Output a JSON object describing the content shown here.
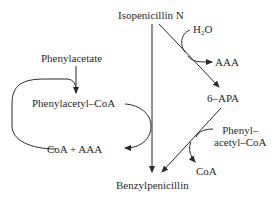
{
  "diagram": {
    "nodes": {
      "isopenicillin_n": "Isopenicillin N",
      "water_prefix": "H",
      "water_sub": "2",
      "water_suffix": "O",
      "aaa_top": "AAA",
      "six_apa": "6–APA",
      "phenylacetate": "Phenylacetate",
      "phenylacetyl_coa": "Phenylacetyl–CoA",
      "coa_plus_aaa": "CoA + AAA",
      "phenylacetyl_coa_right_line1": "Phenyl–",
      "phenylacetyl_coa_right_line2": "acetyl–CoA",
      "coa_right": "CoA",
      "benzylpenicillin": "Benzylpenicillin"
    },
    "edges": [
      {
        "from": "Isopenicillin N",
        "to": "Benzylpenicillin",
        "type": "straight"
      },
      {
        "from": "Isopenicillin N",
        "to": "6–APA",
        "type": "straight",
        "inputs": [
          "H2O"
        ],
        "outputs": [
          "AAA"
        ]
      },
      {
        "from": "6–APA",
        "to": "Benzylpenicillin",
        "type": "straight",
        "inputs": [
          "Phenylacetyl–CoA"
        ],
        "outputs": [
          "CoA"
        ]
      },
      {
        "from": "Phenylacetate",
        "to": "Phenylacetyl–CoA",
        "type": "straight"
      },
      {
        "from": "Phenylacetyl–CoA",
        "to": "CoA + AAA",
        "type": "curved",
        "via": "Isopenicillin N → Benzylpenicillin"
      },
      {
        "from": "CoA + AAA",
        "to": "Phenylacetyl–CoA",
        "type": "curved-loop"
      }
    ],
    "colors": {
      "stroke": "#2a2a2a",
      "background": "#ffffff"
    }
  }
}
